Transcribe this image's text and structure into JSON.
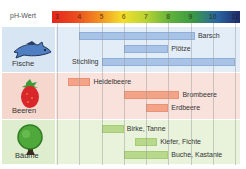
{
  "chart_data": {
    "type": "bar",
    "orientation": "horizontal-range",
    "title": "",
    "xlabel": "pH-Wert",
    "ylabel": "",
    "xlim": [
      3,
      11
    ],
    "ticks": [
      "3",
      "4",
      "5",
      "6",
      "7",
      "8",
      "9",
      "10",
      "11"
    ],
    "scale_colors": [
      "#e5261b",
      "#eb4a1f",
      "#f28f21",
      "#f4df2a",
      "#b9d334",
      "#62b33b",
      "#3a9944",
      "#2b68a3",
      "#1e2b6a"
    ],
    "grid": true,
    "groups": [
      {
        "name": "Fische",
        "icon": "fish-icon",
        "bg": "#e3edf8",
        "label_bg": "#d8e6f4",
        "bar_color": "#a8c3e6",
        "bar_border": "#8eafdb",
        "items": [
          {
            "name": "Barsch",
            "min": 4.0,
            "max": 9.2,
            "label_side": "right"
          },
          {
            "name": "Plötze",
            "min": 6.0,
            "max": 8.0,
            "label_side": "right"
          },
          {
            "name": "Stichling",
            "min": 5.0,
            "max": 11.0,
            "label_side": "left"
          }
        ]
      },
      {
        "name": "Beeren",
        "icon": "strawberry-icon",
        "bg": "#f9e2db",
        "label_bg": "#f6d7ce",
        "bar_color": "#f3a388",
        "bar_border": "#ec9274",
        "items": [
          {
            "name": "Heidelbeere",
            "min": 3.5,
            "max": 4.5,
            "label_side": "right"
          },
          {
            "name": "Brombeere",
            "min": 6.0,
            "max": 8.5,
            "label_side": "right"
          },
          {
            "name": "Erdbeere",
            "min": 7.0,
            "max": 8.0,
            "label_side": "right"
          }
        ]
      },
      {
        "name": "Bäume",
        "icon": "tree-icon",
        "bg": "#e9f3dc",
        "label_bg": "#deedcd",
        "bar_color": "#b8d98b",
        "bar_border": "#a6cd74",
        "items": [
          {
            "name": "Birke, Tanne",
            "min": 5.0,
            "max": 6.0,
            "label_side": "right"
          },
          {
            "name": "Kiefer, Fichte",
            "min": 6.5,
            "max": 7.5,
            "label_side": "right"
          },
          {
            "name": "Buche, Kastanie",
            "min": 6.0,
            "max": 8.0,
            "label_side": "right"
          }
        ]
      }
    ]
  }
}
